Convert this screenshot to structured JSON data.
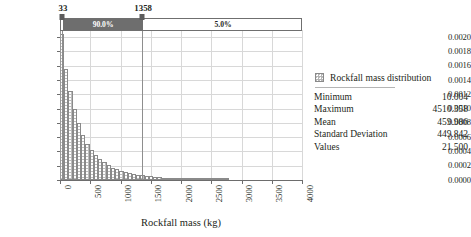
{
  "chart_data": {
    "type": "bar",
    "title": "",
    "subtitle": "",
    "xlabel": "Rockfall mass (kg)",
    "ylabel": "",
    "xlim": [
      0,
      4000
    ],
    "ylim": [
      0,
      0.0021
    ],
    "grid": true,
    "legend_position": "right",
    "xticks": [
      "0",
      "500",
      "1000",
      "1500",
      "2000",
      "2500",
      "3000",
      "3500",
      "4000"
    ],
    "xtick_values": [
      0,
      500,
      1000,
      1500,
      2000,
      2500,
      3000,
      3500,
      4000
    ],
    "yticks": [
      "0.0000",
      "0.0002",
      "0.0004",
      "0.0006",
      "0.0008",
      "0.0010",
      "0.0012",
      "0.0014",
      "0.0016",
      "0.0018",
      "0.0020"
    ],
    "ytick_values": [
      0,
      0.0002,
      0.0004,
      0.0006,
      0.0008,
      0.001,
      0.0012,
      0.0014,
      0.0016,
      0.0018,
      0.002
    ],
    "bin_width": 70,
    "bin_starts": [
      0,
      70,
      140,
      210,
      280,
      350,
      420,
      490,
      560,
      630,
      700,
      770,
      840,
      910,
      980,
      1050,
      1120,
      1190,
      1260,
      1330,
      1400,
      1470,
      1540,
      1610,
      1680,
      1750,
      1820,
      1890,
      1960,
      2030,
      2100,
      2170,
      2240,
      2310,
      2380,
      2450,
      2520,
      2590,
      2660,
      2730
    ],
    "values": [
      0.00205,
      0.00156,
      0.00125,
      0.001,
      0.0008,
      0.00063,
      0.0005,
      0.00042,
      0.00035,
      0.00029,
      0.00025,
      0.00021,
      0.000175,
      0.00015,
      0.000128,
      0.000112,
      9.8e-05,
      8.6e-05,
      7.5e-05,
      6.5e-05,
      5.7e-05,
      5e-05,
      4.3e-05,
      3.7e-05,
      3.2e-05,
      2.8e-05,
      2.4e-05,
      2.1e-05,
      1.8e-05,
      1.6e-05,
      1.4e-05,
      1.2e-05,
      1e-05,
      8.5e-06,
      7e-06,
      5.8e-06,
      4.6e-06,
      3.6e-06,
      2.6e-06,
      1.6e-06
    ],
    "series": [
      {
        "name": "Rockfall mass distribution",
        "values": [
          0.00205,
          0.00156,
          0.00125,
          0.001,
          0.0008,
          0.00063,
          0.0005,
          0.00042,
          0.00035,
          0.00029,
          0.00025,
          0.00021,
          0.000175,
          0.00015,
          0.000128,
          0.000112,
          9.8e-05,
          8.6e-05,
          7.5e-05,
          6.5e-05,
          5.7e-05,
          5e-05,
          4.3e-05,
          3.7e-05,
          3.2e-05,
          2.8e-05,
          2.4e-05,
          2.1e-05,
          1.8e-05,
          1.6e-05,
          1.4e-05,
          1.2e-05,
          1e-05,
          8.5e-06,
          7e-06,
          5.8e-06,
          4.6e-06,
          3.6e-06,
          2.6e-06,
          1.6e-06
        ]
      }
    ],
    "annotations": {
      "percentile_band": {
        "left_marker_value": 33,
        "right_marker_value": 1358,
        "left_segment_label": "90.0%",
        "right_segment_label": "5.0%",
        "left_segment_color": "#6e6e6e",
        "right_segment_color": "#ffffff"
      }
    }
  },
  "legend": {
    "swatch_icon": "hatched-square-swatch",
    "title": "Rockfall mass distribution",
    "stats": [
      {
        "name": "Minimum",
        "value": "10.004"
      },
      {
        "name": "Maximum",
        "value": "4510.358"
      },
      {
        "name": "Mean",
        "value": "459.986"
      },
      {
        "name": "Standard Deviation",
        "value": "449.842"
      },
      {
        "name": "Values",
        "value": "21.500"
      }
    ]
  },
  "colors": {
    "bar_fill": "#bdbdbd",
    "bar_edge": "#8a8a8a",
    "gridline": "#d8d8d8",
    "axis": "#6d6d6d",
    "band_dark": "#6e6e6e",
    "text": "#231f20"
  }
}
